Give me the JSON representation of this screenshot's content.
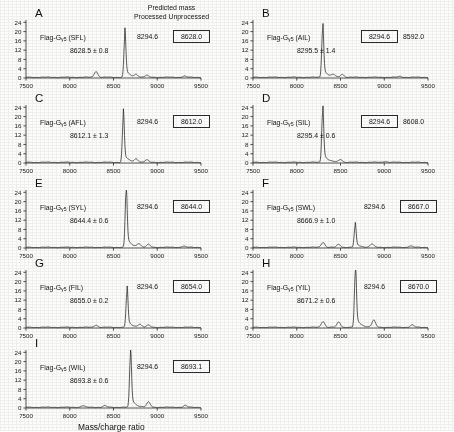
{
  "figure": {
    "xaxis_title": "Mass/charge ratio",
    "header": {
      "line1": "Predicted mass",
      "line2": "Processed Unprocessed"
    }
  },
  "axes": {
    "yticks": [
      "0",
      "4",
      "8",
      "12",
      "16",
      "20",
      "24"
    ],
    "xticks": [
      "7500",
      "8000",
      "8500",
      "9000",
      "9500"
    ],
    "xlim": [
      7500,
      9500
    ],
    "ylim": [
      0,
      25
    ]
  },
  "panels": [
    {
      "letter": "A",
      "sample_prefix": "Flag-G",
      "sample_sub": "γ5",
      "sample_suffix": " (SFL)",
      "sample_full": "Flag-Gγ5 (SFL)",
      "measured": "8628.5 ± 0.8",
      "predicted_processed": "8294.6",
      "predicted_unprocessed": "8628.0",
      "boxed": "unprocessed"
    },
    {
      "letter": "B",
      "sample_prefix": "Flag-G",
      "sample_sub": "γ5",
      "sample_suffix": " (AIL)",
      "sample_full": "Flag-Gγ5 (AIL)",
      "measured": "8295.5 ± 1.4",
      "predicted_processed": "8294.6",
      "predicted_unprocessed": "8592.0",
      "boxed": "processed"
    },
    {
      "letter": "C",
      "sample_prefix": "Flag-G",
      "sample_sub": "γ5",
      "sample_suffix": " (AFL)",
      "sample_full": "Flag-Gγ5 (AFL)",
      "measured": "8612.1 ± 1.3",
      "predicted_processed": "8294.6",
      "predicted_unprocessed": "8612.0",
      "boxed": "unprocessed"
    },
    {
      "letter": "D",
      "sample_prefix": "Flag-G",
      "sample_sub": "γ5",
      "sample_suffix": " (SIL)",
      "sample_full": "Flag-Gγ5 (SIL)",
      "measured": "8295.4 ± 0.6",
      "predicted_processed": "8294.6",
      "predicted_unprocessed": "8608.0",
      "boxed": "processed"
    },
    {
      "letter": "E",
      "sample_prefix": "Flag-G",
      "sample_sub": "γ5",
      "sample_suffix": " (SYL)",
      "sample_full": "Flag-Gγ5 (SYL)",
      "measured": "8644.4 ± 0.6",
      "predicted_processed": "8294.6",
      "predicted_unprocessed": "8644.0",
      "boxed": "unprocessed"
    },
    {
      "letter": "F",
      "sample_prefix": "Flag-G",
      "sample_sub": "γ5",
      "sample_suffix": " (SWL)",
      "sample_full": "Flag-Gγ5 (SWL)",
      "measured": "8666.9 ± 1.0",
      "predicted_processed": "8294.6",
      "predicted_unprocessed": "8667.0",
      "boxed": "unprocessed"
    },
    {
      "letter": "G",
      "sample_prefix": "Flag-G",
      "sample_sub": "γ5",
      "sample_suffix": " (FIL)",
      "sample_full": "Flag-Gγ5 (FIL)",
      "measured": "8655.0 ± 0.2",
      "predicted_processed": "8294.6",
      "predicted_unprocessed": "8654.0",
      "boxed": "unprocessed"
    },
    {
      "letter": "H",
      "sample_prefix": "Flag-G",
      "sample_sub": "γ5",
      "sample_suffix": " (YIL)",
      "sample_full": "Flag-Gγ5 (YIL)",
      "measured": "8671.2 ± 0.6",
      "predicted_processed": "8294.6",
      "predicted_unprocessed": "8670.0",
      "boxed": "unprocessed"
    },
    {
      "letter": "I",
      "sample_prefix": "Flag-G",
      "sample_sub": "γ5",
      "sample_suffix": " (WIL)",
      "sample_full": "Flag-Gγ5 (WIL)",
      "measured": "8693.8 ± 0.6",
      "predicted_processed": "8294.6",
      "predicted_unprocessed": "8693.1",
      "boxed": "unprocessed"
    }
  ],
  "chart_data": {
    "type": "line",
    "title": "",
    "xlabel": "Mass/charge ratio",
    "ylabel": "",
    "xlim": [
      7500,
      9500
    ],
    "ylim": [
      0,
      25
    ],
    "grid": false,
    "legend": "none",
    "panel_count": 9,
    "note": "Nine MALDI mass spectra of Flag-G-gamma-5 C-terminal sequence variants; intensity (arbitrary units, 0-24) vs mass/charge ratio.",
    "spectra": [
      {
        "panel": "A",
        "label": "Flag-Gγ5 (SFL)",
        "measured_mass": 8628.5,
        "measured_error": 0.8,
        "predicted_processed": 8294.6,
        "predicted_unprocessed": 8628.0,
        "boxed_value": 8628.0,
        "peaks": [
          {
            "mz": 8300,
            "intensity": 2.6
          },
          {
            "mz": 8630,
            "intensity": 17.5
          },
          {
            "mz": 8760,
            "intensity": 1.1
          },
          {
            "mz": 8880,
            "intensity": 0.8
          },
          {
            "mz": 9310,
            "intensity": 0.5
          }
        ]
      },
      {
        "panel": "B",
        "label": "Flag-Gγ5 (AIL)",
        "measured_mass": 8295.5,
        "measured_error": 1.4,
        "predicted_processed": 8294.6,
        "predicted_unprocessed": 8592.0,
        "boxed_value": 8294.6,
        "peaks": [
          {
            "mz": 8296,
            "intensity": 20.5
          },
          {
            "mz": 8420,
            "intensity": 0.9
          },
          {
            "mz": 8520,
            "intensity": 1.3
          },
          {
            "mz": 9180,
            "intensity": 0.4
          }
        ]
      },
      {
        "panel": "C",
        "label": "Flag-Gγ5 (AFL)",
        "measured_mass": 8612.1,
        "measured_error": 1.3,
        "predicted_processed": 8294.6,
        "predicted_unprocessed": 8612.0,
        "boxed_value": 8612.0,
        "peaks": [
          {
            "mz": 8612,
            "intensity": 19.0
          },
          {
            "mz": 8760,
            "intensity": 1.4
          },
          {
            "mz": 8880,
            "intensity": 1.0
          }
        ]
      },
      {
        "panel": "D",
        "label": "Flag-Gγ5 (SIL)",
        "measured_mass": 8295.4,
        "measured_error": 0.6,
        "predicted_processed": 8294.6,
        "predicted_unprocessed": 8608.0,
        "boxed_value": 8294.6,
        "peaks": [
          {
            "mz": 8296,
            "intensity": 21.5
          },
          {
            "mz": 8500,
            "intensity": 1.2
          },
          {
            "mz": 9010,
            "intensity": 0.4
          }
        ]
      },
      {
        "panel": "E",
        "label": "Flag-Gγ5 (SYL)",
        "measured_mass": 8644.4,
        "measured_error": 0.6,
        "predicted_processed": 8294.6,
        "predicted_unprocessed": 8644.0,
        "boxed_value": 8644.0,
        "peaks": [
          {
            "mz": 8644,
            "intensity": 23.5
          },
          {
            "mz": 8790,
            "intensity": 1.5
          },
          {
            "mz": 8900,
            "intensity": 1.2
          },
          {
            "mz": 9300,
            "intensity": 0.5
          }
        ]
      },
      {
        "panel": "F",
        "label": "Flag-Gγ5 (SWL)",
        "measured_mass": 8666.9,
        "measured_error": 1.0,
        "predicted_processed": 8294.6,
        "predicted_unprocessed": 8667.0,
        "boxed_value": 8667.0,
        "peaks": [
          {
            "mz": 8300,
            "intensity": 2.2
          },
          {
            "mz": 8480,
            "intensity": 1.3
          },
          {
            "mz": 8667,
            "intensity": 9.0
          },
          {
            "mz": 8860,
            "intensity": 1.4
          },
          {
            "mz": 9300,
            "intensity": 0.6
          }
        ]
      },
      {
        "panel": "G",
        "label": "Flag-Gγ5 (FIL)",
        "measured_mass": 8655.0,
        "measured_error": 0.2,
        "predicted_processed": 8294.6,
        "predicted_unprocessed": 8654.0,
        "boxed_value": 8654.0,
        "peaks": [
          {
            "mz": 8300,
            "intensity": 1.0
          },
          {
            "mz": 8654,
            "intensity": 15.0
          },
          {
            "mz": 8800,
            "intensity": 1.3
          },
          {
            "mz": 8900,
            "intensity": 0.9
          }
        ]
      },
      {
        "panel": "H",
        "label": "Flag-Gγ5 (YIL)",
        "measured_mass": 8671.2,
        "measured_error": 0.6,
        "predicted_processed": 8294.6,
        "predicted_unprocessed": 8670.0,
        "boxed_value": 8670.0,
        "peaks": [
          {
            "mz": 8300,
            "intensity": 2.6
          },
          {
            "mz": 8480,
            "intensity": 2.3
          },
          {
            "mz": 8670,
            "intensity": 24.0
          },
          {
            "mz": 8880,
            "intensity": 3.0
          },
          {
            "mz": 9320,
            "intensity": 1.0
          }
        ]
      },
      {
        "panel": "I",
        "label": "Flag-Gγ5 (WIL)",
        "measured_mass": 8693.8,
        "measured_error": 0.6,
        "predicted_processed": 8294.6,
        "predicted_unprocessed": 8693.1,
        "boxed_value": 8693.1,
        "peaks": [
          {
            "mz": 8150,
            "intensity": 0.7
          },
          {
            "mz": 8400,
            "intensity": 0.7
          },
          {
            "mz": 8694,
            "intensity": 22.0
          },
          {
            "mz": 8900,
            "intensity": 2.2
          },
          {
            "mz": 9320,
            "intensity": 0.8
          }
        ]
      }
    ]
  }
}
